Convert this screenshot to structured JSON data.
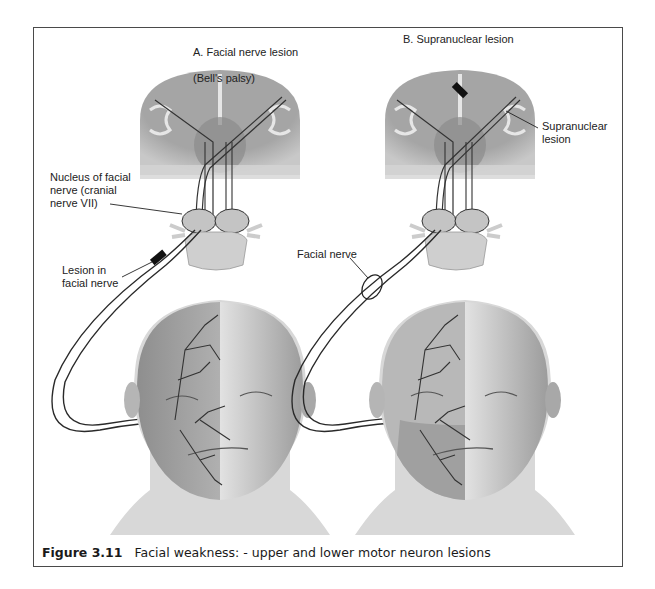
{
  "figure": {
    "number": "Figure 3.11",
    "caption": "Facial weakness: - upper and lower motor neuron lesions"
  },
  "panels": [
    {
      "id": "A",
      "title_line1": "A. Facial nerve lesion",
      "title_line2": "(Bell's palsy)",
      "labels": {
        "nucleus": "Nucleus of facial\nnerve (cranial\nnerve VII)",
        "lesion": "Lesion in\nfacial nerve"
      }
    },
    {
      "id": "B",
      "title_line1": "B. Supranuclear lesion",
      "labels": {
        "supranuclear": "Supranuclear\nlesion",
        "facial_nerve": "Facial nerve"
      }
    }
  ],
  "colors": {
    "frame": "#4a4a4a",
    "brain_gray": "#a8a8a8",
    "white_matter": "#d0d0d0",
    "nerve": "#2a2a2a",
    "skin_dark": "#9a9a9a",
    "skin_light": "#cfcfcf"
  }
}
